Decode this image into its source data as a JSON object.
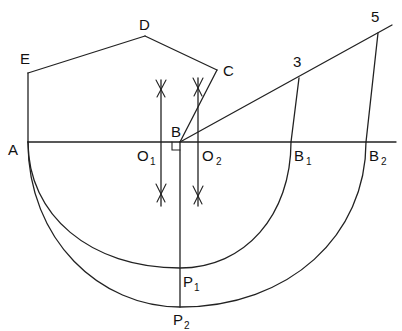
{
  "diagram": {
    "type": "geometric-construction",
    "labels": {
      "A": "A",
      "B": "B",
      "C": "C",
      "D": "D",
      "E": "E",
      "O1": {
        "main": "O",
        "sub": "1"
      },
      "O2": {
        "main": "O",
        "sub": "2"
      },
      "B1": {
        "main": "B",
        "sub": "1"
      },
      "B2": {
        "main": "B",
        "sub": "2"
      },
      "P1": {
        "main": "P",
        "sub": "1"
      },
      "P2": {
        "main": "P",
        "sub": "2"
      },
      "p3": "3",
      "p5": "5"
    },
    "stroke_color": "#222222",
    "background": "#ffffff"
  }
}
